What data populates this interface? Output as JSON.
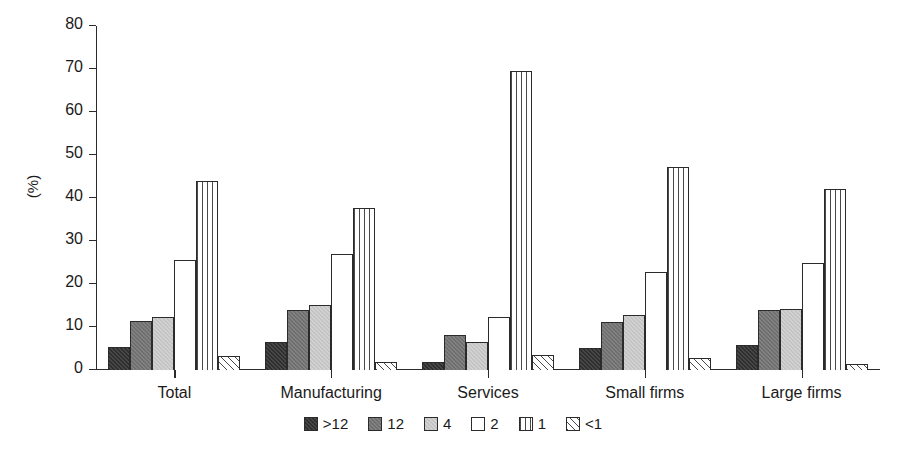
{
  "chart_data": {
    "type": "bar",
    "title": "",
    "subtitle": "",
    "xlabel": "",
    "ylabel": "(%)",
    "ylim": [
      0,
      80
    ],
    "yticks": [
      0,
      10,
      20,
      30,
      40,
      50,
      60,
      70,
      80
    ],
    "grid": false,
    "legend_position": "bottom",
    "categories": [
      "Total",
      "Manufacturing",
      "Services",
      "Small firms",
      "Large firms"
    ],
    "series": [
      {
        "name": ">12",
        "fill": "fill-dark",
        "values": [
          5.3,
          6.4,
          1.8,
          5.2,
          5.9
        ]
      },
      {
        "name": "12",
        "fill": "fill-midgray",
        "values": [
          11.5,
          13.9,
          8.1,
          11.2,
          14.0
        ]
      },
      {
        "name": "4",
        "fill": "fill-lightgray",
        "values": [
          12.3,
          15.2,
          6.5,
          12.7,
          14.2
        ]
      },
      {
        "name": "2",
        "fill": "fill-white",
        "values": [
          25.6,
          27.0,
          12.4,
          22.8,
          25.0
        ]
      },
      {
        "name": "1",
        "fill": "fill-vlines",
        "values": [
          44.0,
          37.6,
          69.5,
          47.3,
          42.0
        ]
      },
      {
        "name": "<1",
        "fill": "fill-hatch",
        "values": [
          3.2,
          1.8,
          3.5,
          2.8,
          1.4
        ]
      }
    ],
    "colors": {
      "axis": "#2b2b2b",
      "text": "#1a1a1a",
      "background": "#ffffff"
    }
  }
}
